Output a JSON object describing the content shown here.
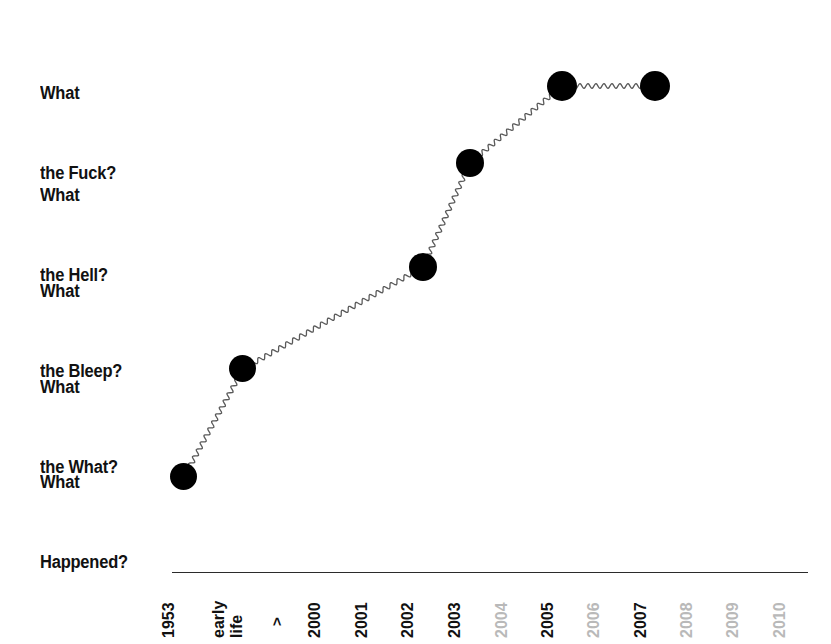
{
  "chart_data": {
    "type": "line",
    "title": "",
    "subtitle": "",
    "xlabel": "",
    "ylabel": "",
    "grid": false,
    "legend": null,
    "style": "hand-drawn squiggly line with large black dots",
    "y_categories": [
      {
        "line1": "What",
        "line2": "the Fuck?",
        "level": 5
      },
      {
        "line1": "What",
        "line2": "the Hell?",
        "level": 4
      },
      {
        "line1": "What",
        "line2": "the Bleep?",
        "level": 3
      },
      {
        "line1": "What",
        "line2": "the What?",
        "level": 2
      },
      {
        "line1": "What",
        "line2": "Happened?",
        "level": 1
      }
    ],
    "x_categories": [
      {
        "label": "1953",
        "dimmed": false
      },
      {
        "label": "early",
        "dimmed": false
      },
      {
        "label": "life",
        "dimmed": false
      },
      {
        "label": ">",
        "dimmed": false
      },
      {
        "label": "2000",
        "dimmed": false
      },
      {
        "label": "2001",
        "dimmed": false
      },
      {
        "label": "2002",
        "dimmed": false
      },
      {
        "label": "2003",
        "dimmed": false
      },
      {
        "label": "2004",
        "dimmed": true
      },
      {
        "label": "2005",
        "dimmed": false
      },
      {
        "label": "2006",
        "dimmed": true
      },
      {
        "label": "2007",
        "dimmed": false
      },
      {
        "label": "2008",
        "dimmed": true
      },
      {
        "label": "2009",
        "dimmed": true
      },
      {
        "label": "2010",
        "dimmed": true
      }
    ],
    "points": [
      {
        "x": "1953",
        "y": "What Happened?",
        "y_level": 1
      },
      {
        "x": "early life",
        "y": "What the What?",
        "y_level": 2
      },
      {
        "x": "2002",
        "y": "What the Bleep?",
        "y_level": 3
      },
      {
        "x": "2003",
        "y": "What the Hell?",
        "y_level": 4
      },
      {
        "x": "2005",
        "y": "What the Fuck?",
        "y_level": 5
      },
      {
        "x": "2007",
        "y": "What the Fuck?",
        "y_level": 5
      }
    ],
    "colors": {
      "marker": "#000000",
      "line": "#555555",
      "axis": "#2b2b2b",
      "text": "#111111",
      "text_dim": "#b9b9b9",
      "background": "#ffffff"
    }
  }
}
